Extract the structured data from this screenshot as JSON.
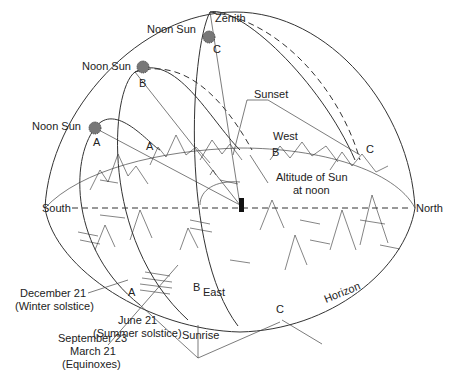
{
  "labels": {
    "zenith": "Zenith",
    "noon_sun_c": "Noon Sun",
    "noon_sun_b": "Noon Sun",
    "noon_sun_a": "Noon Sun",
    "sunset": "Sunset",
    "west": "West",
    "east": "East",
    "south": "South",
    "north": "North",
    "altitude_line1": "Altitude of Sun",
    "altitude_line2": "at noon",
    "horizon": "Horizon",
    "sunrise": "Sunrise",
    "dec_line1": "December 21",
    "dec_line2": "(Winter solstice)",
    "equinox_line1": "September 23",
    "equinox_line2": "March 21",
    "equinox_line3": "(Equinoxes)",
    "june_line1": "June 21",
    "june_line2": "(Summer solstice)"
  },
  "points": {
    "sun_a": "A",
    "sun_b": "B",
    "sun_c": "C",
    "set_a": "A",
    "set_b": "B",
    "set_c": "C",
    "rise_a": "A",
    "rise_b": "B",
    "rise_c": "C"
  },
  "colors": {
    "line": "#333333",
    "sun": "#777777",
    "background": "#ffffff"
  }
}
